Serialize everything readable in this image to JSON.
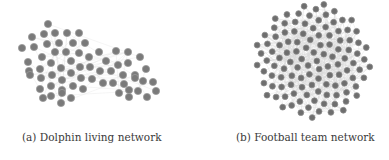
{
  "figures": [
    {
      "id": "a",
      "caption": "(a) Dolphin living network",
      "node_fill": "#7a7a7a",
      "node_stroke": "#9a9a9a",
      "edge_color": "#dcdcdc",
      "node_radius": 3.6,
      "nodes": [
        [
          48,
          24
        ],
        [
          32,
          37
        ],
        [
          44,
          34
        ],
        [
          55,
          33
        ],
        [
          67,
          33
        ],
        [
          79,
          33
        ],
        [
          22,
          48
        ],
        [
          34,
          47
        ],
        [
          47,
          44
        ],
        [
          59,
          43
        ],
        [
          73,
          43
        ],
        [
          85,
          43
        ],
        [
          42,
          57
        ],
        [
          55,
          52
        ],
        [
          66,
          52
        ],
        [
          79,
          53
        ],
        [
          89,
          57
        ],
        [
          99,
          52
        ],
        [
          116,
          51
        ],
        [
          128,
          52
        ],
        [
          28,
          62
        ],
        [
          51,
          63
        ],
        [
          71,
          61
        ],
        [
          80,
          67
        ],
        [
          106,
          61
        ],
        [
          118,
          65
        ],
        [
          128,
          63
        ],
        [
          140,
          57
        ],
        [
          29,
          71
        ],
        [
          40,
          69
        ],
        [
          61,
          68
        ],
        [
          90,
          67
        ],
        [
          100,
          71
        ],
        [
          111,
          71
        ],
        [
          123,
          75
        ],
        [
          135,
          75
        ],
        [
          146,
          69
        ],
        [
          30,
          75
        ],
        [
          41,
          78
        ],
        [
          52,
          75
        ],
        [
          62,
          80
        ],
        [
          71,
          73
        ],
        [
          81,
          78
        ],
        [
          92,
          79
        ],
        [
          103,
          83
        ],
        [
          113,
          83
        ],
        [
          124,
          84
        ],
        [
          135,
          78
        ],
        [
          143,
          81
        ],
        [
          153,
          82
        ],
        [
          40,
          89
        ],
        [
          51,
          86
        ],
        [
          62,
          90
        ],
        [
          73,
          86
        ],
        [
          83,
          89
        ],
        [
          119,
          93
        ],
        [
          129,
          90
        ],
        [
          138,
          91
        ],
        [
          156,
          91
        ],
        [
          43,
          98
        ],
        [
          51,
          96
        ],
        [
          62,
          93
        ],
        [
          71,
          98
        ],
        [
          129,
          97
        ],
        [
          147,
          97
        ],
        [
          61,
          103
        ]
      ]
    },
    {
      "id": "b",
      "caption": "(b) Football team network",
      "node_fill": "#6e6e6e",
      "node_stroke": "#8a8a8a",
      "edge_color": "#d6d6d6",
      "node_radius": 2.9,
      "center": [
        118,
        61
      ],
      "radius": 60,
      "node_count": 115
    }
  ]
}
